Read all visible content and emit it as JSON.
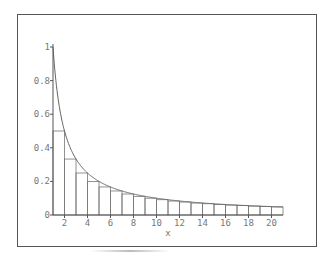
{
  "chart_data": {
    "type": "bar",
    "title": "",
    "xlabel": "x",
    "ylabel": "",
    "xlim": [
      1,
      21
    ],
    "ylim": [
      0,
      1
    ],
    "grid": false,
    "legend": null,
    "x_ticks": [
      "2",
      "4",
      "6",
      "8",
      "10",
      "12",
      "14",
      "16",
      "18",
      "20"
    ],
    "y_ticks": [
      "0",
      "0.2",
      "0.4",
      "0.6",
      "0.8",
      "1"
    ],
    "curve": {
      "name": "y = 1/x",
      "type": "line",
      "x_range": [
        1,
        21
      ]
    },
    "bars": {
      "description": "Lower Riemann sum rectangles of width 1 under y=1/x",
      "left_edges": [
        1,
        2,
        3,
        4,
        5,
        6,
        7,
        8,
        9,
        10,
        11,
        12,
        13,
        14,
        15,
        16,
        17,
        18,
        19,
        20
      ],
      "values": [
        0.5,
        0.333,
        0.25,
        0.2,
        0.167,
        0.143,
        0.125,
        0.111,
        0.1,
        0.091,
        0.083,
        0.077,
        0.071,
        0.067,
        0.063,
        0.059,
        0.056,
        0.053,
        0.05,
        0.048
      ]
    }
  },
  "colors": {
    "axis": "#555555",
    "curve": "#666666",
    "bars": "#777777",
    "text": "#777777",
    "frame": "#555555"
  }
}
